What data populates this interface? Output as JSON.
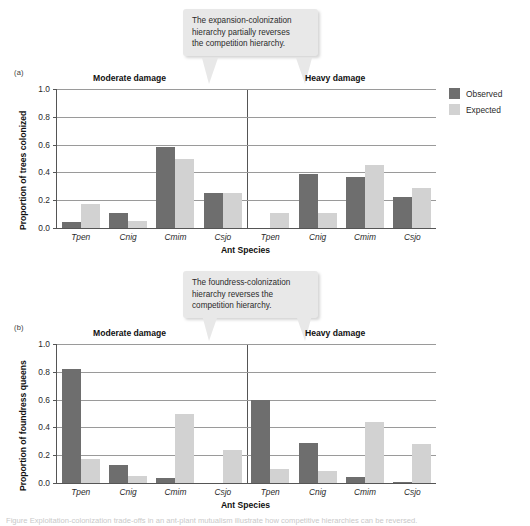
{
  "figure": {
    "legend": {
      "items": [
        {
          "label": "Observed",
          "color": "#6e6e6e",
          "key": "observed"
        },
        {
          "label": "Expected",
          "color": "#d2d2d2",
          "key": "expected"
        }
      ]
    },
    "caption_sliver": "Figure  Exploitation-colonization trade-offs in an ant-plant mutualism illustrate how competitive hierarchies can be reversed."
  },
  "panels": [
    {
      "letter": "(a)",
      "callout": {
        "line1": "The expansion-colonization",
        "line2": "hierarchy partially reverses",
        "line3": "the competition hierarchy."
      },
      "ylabel": "Proportion of trees colonized",
      "xlabel": "Ant Species",
      "subplots": [
        {
          "title": "Moderate damage"
        },
        {
          "title": "Heavy damage"
        }
      ]
    },
    {
      "letter": "(b)",
      "callout": {
        "line1": "The foundress-colonization",
        "line2": "hierarchy reverses the",
        "line3": "competition hierarchy."
      },
      "ylabel": "Proportion of foundress queens",
      "xlabel": "Ant Species",
      "subplots": [
        {
          "title": "Moderate damage"
        },
        {
          "title": "Heavy damage"
        }
      ]
    }
  ],
  "chart_data": [
    {
      "type": "bar",
      "panel": "(a)",
      "title": "Proportion of trees colonized",
      "xlabel": "Ant Species",
      "ylabel": "Proportion of trees colonized",
      "ylim": [
        0.0,
        1.0
      ],
      "yticks": [
        "0.0",
        "0.2",
        "0.4",
        "0.6",
        "0.8",
        "1.0"
      ],
      "ytick_values": [
        0.0,
        0.2,
        0.4,
        0.6,
        0.8,
        1.0
      ],
      "grid": true,
      "legend_position": "right",
      "groups": [
        {
          "facet": "Moderate damage",
          "categories": [
            "Tpen",
            "Cnig",
            "Cmim",
            "Csjo"
          ],
          "series": [
            {
              "name": "Observed",
              "values": [
                0.04,
                0.11,
                0.58,
                0.25
              ]
            },
            {
              "name": "Expected",
              "values": [
                0.17,
                0.05,
                0.5,
                0.25
              ]
            }
          ]
        },
        {
          "facet": "Heavy damage",
          "categories": [
            "Tpen",
            "Cnig",
            "Cmim",
            "Csjo"
          ],
          "series": [
            {
              "name": "Observed",
              "values": [
                0.0,
                0.39,
                0.37,
                0.22
              ]
            },
            {
              "name": "Expected",
              "values": [
                0.11,
                0.11,
                0.45,
                0.29
              ]
            }
          ]
        }
      ]
    },
    {
      "type": "bar",
      "panel": "(b)",
      "title": "Proportion of foundress queens",
      "xlabel": "Ant Species",
      "ylabel": "Proportion of foundress queens",
      "ylim": [
        0.0,
        1.0
      ],
      "yticks": [
        "0.0",
        "0.2",
        "0.4",
        "0.6",
        "0.8",
        "1.0"
      ],
      "ytick_values": [
        0.0,
        0.2,
        0.4,
        0.6,
        0.8,
        1.0
      ],
      "grid": true,
      "legend_position": "none",
      "groups": [
        {
          "facet": "Moderate damage",
          "categories": [
            "Tpen",
            "Cnig",
            "Cmim",
            "Csjo"
          ],
          "series": [
            {
              "name": "Observed",
              "values": [
                0.82,
                0.13,
                0.035,
                0.0
              ]
            },
            {
              "name": "Expected",
              "values": [
                0.17,
                0.05,
                0.5,
                0.24
              ]
            }
          ]
        },
        {
          "facet": "Heavy damage",
          "categories": [
            "Tpen",
            "Cnig",
            "Cmim",
            "Csjo"
          ],
          "series": [
            {
              "name": "Observed",
              "values": [
                0.6,
                0.285,
                0.045,
                0.005
              ]
            },
            {
              "name": "Expected",
              "values": [
                0.1,
                0.09,
                0.44,
                0.28
              ]
            }
          ]
        }
      ]
    }
  ]
}
